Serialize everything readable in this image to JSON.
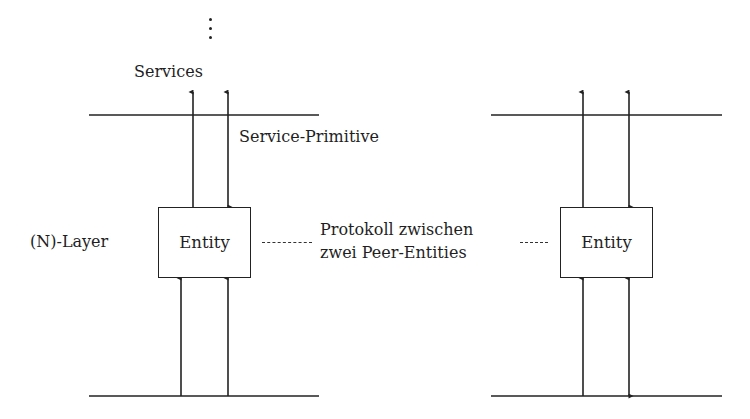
{
  "diagram": {
    "title": "",
    "ellipsis": "⋮",
    "services_label": "Services",
    "service_primitive_label": "Service-Primitive",
    "layer_label": "(N)-Layer",
    "protocol_label_line1": "Protokoll zwischen",
    "protocol_label_line2": "zwei Peer-Entities",
    "left_entity": {
      "label": "Entity",
      "up_arrows_top": [
        "up",
        "down"
      ],
      "arrows_bottom": [
        "up",
        "up"
      ]
    },
    "right_entity": {
      "label": "Entity",
      "up_arrows_top": [
        "up",
        "bidirectional"
      ],
      "arrows_bottom": [
        "up",
        "bidirectional"
      ]
    },
    "colors": {
      "line": "#222222",
      "text": "#1f1f1f",
      "background": "#ffffff"
    }
  }
}
